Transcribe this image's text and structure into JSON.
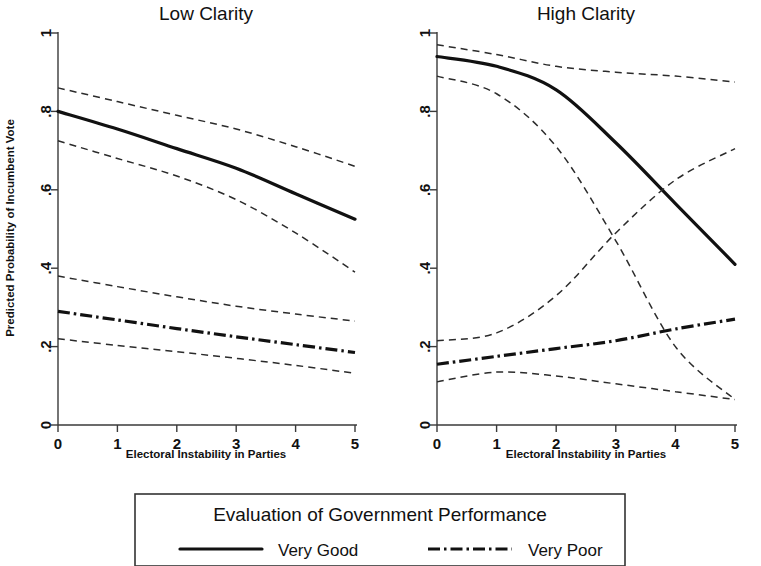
{
  "figure": {
    "background": "#ffffff",
    "ink": "#111111"
  },
  "panels": [
    {
      "id": "low",
      "title": "Low Clarity"
    },
    {
      "id": "high",
      "title": "High Clarity"
    }
  ],
  "axes": {
    "xlabel": "Electoral Instability in Parties",
    "ylabel": "Predicted Probability of Incumbent Vote",
    "xticks": [
      "0",
      "1",
      "2",
      "3",
      "4",
      "5"
    ],
    "yticks": [
      "0",
      ".2",
      ".4",
      ".6",
      ".8",
      "1"
    ]
  },
  "legend": {
    "title": "Evaluation of Government Performance",
    "entries": [
      {
        "label": "Very Good",
        "style": "solid"
      },
      {
        "label": "Very Poor",
        "style": "dash-dot"
      }
    ]
  },
  "chart_data": {
    "type": "line",
    "title": "",
    "xlabel": "Electoral Instability in Parties",
    "ylabel": "Predicted Probability of Incumbent Vote",
    "xlim": [
      0,
      5
    ],
    "ylim": [
      0,
      1
    ],
    "grid": false,
    "legend_position": "bottom",
    "x": [
      0,
      1,
      2,
      3,
      4,
      5
    ],
    "panels": [
      {
        "panel": "Low Clarity",
        "series": [
          {
            "name": "Very Good",
            "style": "solid",
            "values": [
              0.8,
              0.755,
              0.705,
              0.655,
              0.59,
              0.525
            ]
          },
          {
            "name": "Very Good upper CI",
            "style": "dashed",
            "values": [
              0.86,
              0.825,
              0.79,
              0.755,
              0.71,
              0.66
            ]
          },
          {
            "name": "Very Good lower CI",
            "style": "dashed",
            "values": [
              0.725,
              0.68,
              0.635,
              0.575,
              0.49,
              0.39
            ]
          },
          {
            "name": "Very Poor",
            "style": "dash-dot",
            "values": [
              0.29,
              0.268,
              0.246,
              0.225,
              0.205,
              0.185
            ]
          },
          {
            "name": "Very Poor upper CI",
            "style": "dashed",
            "values": [
              0.38,
              0.353,
              0.327,
              0.303,
              0.283,
              0.265
            ]
          },
          {
            "name": "Very Poor lower CI",
            "style": "dashed",
            "values": [
              0.22,
              0.203,
              0.187,
              0.17,
              0.152,
              0.132
            ]
          }
        ]
      },
      {
        "panel": "High Clarity",
        "series": [
          {
            "name": "Very Good",
            "style": "solid",
            "values": [
              0.94,
              0.915,
              0.855,
              0.72,
              0.565,
              0.41
            ]
          },
          {
            "name": "Very Good upper CI",
            "style": "dashed",
            "values": [
              0.97,
              0.945,
              0.915,
              0.9,
              0.89,
              0.875
            ]
          },
          {
            "name": "Very Good lower CI",
            "style": "dashed",
            "values": [
              0.89,
              0.845,
              0.71,
              0.47,
              0.2,
              0.065
            ]
          },
          {
            "name": "Very Poor",
            "style": "dash-dot",
            "values": [
              0.155,
              0.175,
              0.195,
              0.215,
              0.245,
              0.27
            ]
          },
          {
            "name": "Very Poor upper CI",
            "style": "dashed",
            "values": [
              0.215,
              0.235,
              0.33,
              0.49,
              0.625,
              0.705
            ]
          },
          {
            "name": "Very Poor lower CI",
            "style": "dashed",
            "values": [
              0.11,
              0.135,
              0.125,
              0.105,
              0.085,
              0.065
            ]
          }
        ]
      }
    ]
  }
}
